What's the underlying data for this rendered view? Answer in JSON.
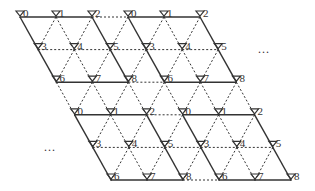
{
  "diagram": {
    "type": "skewed-triangular-lattice",
    "grid": {
      "rows": 6,
      "cols": 6,
      "origin_x": 20,
      "origin_y": 17,
      "dx": 36,
      "dy": 32.6,
      "skew_per_row": 18.2,
      "cluster_size": 3
    },
    "labels": [
      [
        "0",
        "1",
        "2",
        "0",
        "1",
        "2"
      ],
      [
        "3",
        "4",
        "5",
        "3",
        "4",
        "5"
      ],
      [
        "6",
        "7",
        "8",
        "6",
        "7",
        "8"
      ],
      [
        "0",
        "1",
        "2",
        "0",
        "1",
        "2"
      ],
      [
        "3",
        "4",
        "5",
        "3",
        "4",
        "5"
      ],
      [
        "6",
        "7",
        "8",
        "6",
        "7",
        "8"
      ]
    ],
    "node_icon": "antenna-icon",
    "ellipses": [
      {
        "text": "...",
        "x": 258,
        "y": 53
      },
      {
        "text": "...",
        "x": 44,
        "y": 151
      }
    ],
    "colors": {
      "line": "#333333",
      "label": "#333333"
    }
  }
}
